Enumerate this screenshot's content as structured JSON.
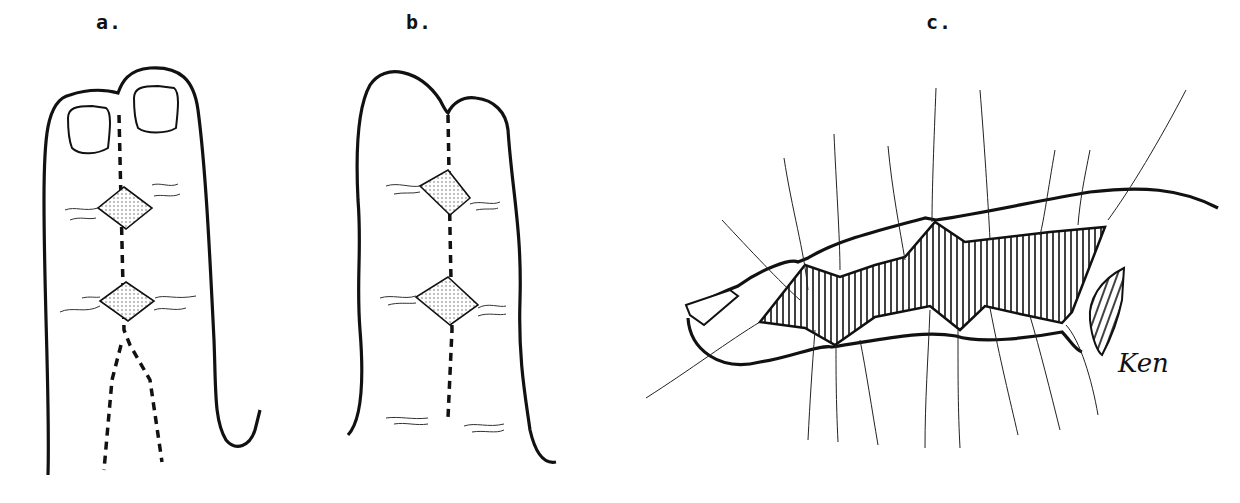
{
  "figure": {
    "panels": [
      {
        "id": "a",
        "label": "a.",
        "description": "Syndactylized fingers with nails, dashed separation line with two diamond-shaped dotted flaps"
      },
      {
        "id": "b",
        "label": "b.",
        "description": "Fused fingertips with dashed midline and two diamond-shaped dotted flaps"
      },
      {
        "id": "c",
        "label": "c.",
        "description": "Lateral view of finger with hatched graft area secured by tie-over sutures"
      }
    ],
    "signature": "Ken",
    "colors": {
      "ink": "#111111",
      "background": "#ffffff",
      "stipple": "#555555"
    }
  }
}
